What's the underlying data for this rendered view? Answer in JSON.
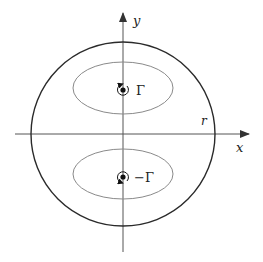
{
  "figure": {
    "axes": {
      "x_label": "x",
      "y_label": "y"
    },
    "boundary": {
      "label": "r"
    },
    "vortices": [
      {
        "label": "Γ",
        "position": "upper",
        "rotation": "counterclockwise"
      },
      {
        "label": "−Γ",
        "position": "lower",
        "rotation": "clockwise"
      }
    ],
    "colors": {
      "axis": "#555555",
      "boundary": "#2a2a2a",
      "streamline": "#8a8a8a",
      "vortex": "#111111"
    }
  }
}
